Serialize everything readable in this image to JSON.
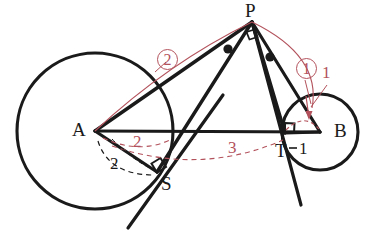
{
  "figure": {
    "background": "#ffffff",
    "stroke_color": "#1a1a1a",
    "accent_color": "#b3525c",
    "width": 367,
    "height": 239
  },
  "points": [
    {
      "id": "P",
      "label": "P",
      "x": 252,
      "y": 22,
      "label_x": 245,
      "label_y": 2
    },
    {
      "id": "A",
      "label": "A",
      "x": 95,
      "y": 131,
      "label_x": 72,
      "label_y": 121
    },
    {
      "id": "B",
      "label": "B",
      "x": 320,
      "y": 132,
      "label_x": 335,
      "label_y": 122
    },
    {
      "id": "S",
      "label": "S",
      "x": 157,
      "y": 172,
      "label_x": 161,
      "label_y": 175
    },
    {
      "id": "T",
      "label": "T",
      "x": 285,
      "y": 133,
      "label_x": 276,
      "label_y": 143
    }
  ],
  "circles": [
    {
      "id": "circle-A",
      "center": "A",
      "cx": 95,
      "cy": 131,
      "r": 78
    },
    {
      "id": "circle-B",
      "center": "B",
      "cx": 320,
      "cy": 132,
      "r": 38
    }
  ],
  "segments": [
    {
      "id": "AB",
      "from": "A",
      "to": "B"
    },
    {
      "id": "AP",
      "from": "A",
      "to": "P"
    },
    {
      "id": "PS",
      "from": "P",
      "to": "S"
    },
    {
      "id": "PT",
      "from": "P",
      "to": "T"
    },
    {
      "id": "PB",
      "from": "P",
      "to": "B"
    },
    {
      "id": "AS",
      "from": "A",
      "to": "S"
    },
    {
      "id": "BT",
      "from": "B",
      "to": "T"
    }
  ],
  "labels": {
    "length_as": "2",
    "arc_a_red": "2",
    "arc_ab_red": "3",
    "length_bt": "1",
    "marker_one": "1",
    "circled_one": "1",
    "circled_two": "2"
  },
  "marks": {
    "right_angle_at_S": "right-angle",
    "right_angle_at_T": "right-angle",
    "right_angle_at_P": "right-angle",
    "angle_dots": 2
  }
}
